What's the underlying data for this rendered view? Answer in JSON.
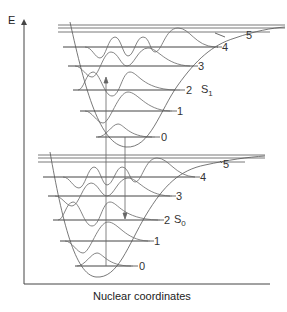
{
  "figure": {
    "y_axis_label": "E",
    "x_axis_label": "Nuclear coordinates",
    "states": [
      {
        "name": "S",
        "subscript": "1",
        "levels": [
          "0",
          "1",
          "2",
          "3",
          "4",
          "5"
        ]
      },
      {
        "name": "S",
        "subscript": "0",
        "levels": [
          "0",
          "1",
          "2",
          "3",
          "4",
          "5"
        ]
      }
    ],
    "transitions": [
      {
        "type": "absorption",
        "from": "S0 v=0",
        "to": "S1 v=2",
        "direction": "up"
      },
      {
        "type": "emission",
        "from": "S1 v=0",
        "to": "S0 v=2",
        "direction": "down"
      }
    ],
    "colors": {
      "line": "#444444",
      "background": "#ffffff"
    }
  }
}
